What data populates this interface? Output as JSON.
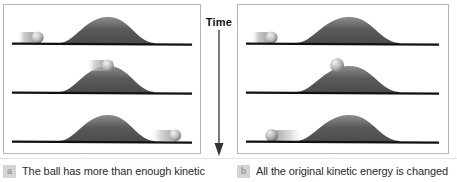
{
  "figure": {
    "time_axis": {
      "label": "Time",
      "direction": "down",
      "arrow_icon": "down-arrow-icon"
    },
    "panels": [
      {
        "id": "a",
        "badge": "a",
        "caption": "The ball has more than enough kinetic",
        "frames": [
          {
            "index": 0,
            "description": "Ball approaching hill from the left with motion blur",
            "ball_x_pct": 14,
            "ball_on_hill": false,
            "motion_blur": true,
            "blur_direction": "left"
          },
          {
            "index": 1,
            "description": "Ball at the crest of the hill, still moving",
            "ball_x_pct": 52,
            "ball_on_hill": true,
            "motion_blur": true,
            "blur_direction": "left"
          },
          {
            "index": 2,
            "description": "Ball has crossed over and moves away to the right",
            "ball_x_pct": 86,
            "ball_on_hill": false,
            "motion_blur": true,
            "blur_direction": "left"
          }
        ]
      },
      {
        "id": "b",
        "badge": "b",
        "caption": "All the original kinetic energy is changed",
        "frames": [
          {
            "index": 0,
            "description": "Ball approaching hill from the left with motion blur",
            "ball_x_pct": 14,
            "ball_on_hill": false,
            "motion_blur": true,
            "blur_direction": "left"
          },
          {
            "index": 1,
            "description": "Ball at rest on the crest of the hill",
            "ball_x_pct": 47,
            "ball_on_hill": true,
            "motion_blur": false,
            "blur_direction": "none"
          },
          {
            "index": 2,
            "description": "Ball rolled back down and moves away to the left",
            "ball_x_pct": 15,
            "ball_on_hill": false,
            "motion_blur": true,
            "blur_direction": "right"
          }
        ]
      }
    ],
    "colors": {
      "ground_line": "#111111",
      "hill_dark": "#4e4e4e",
      "hill_light": "#8d8d8d",
      "ball_light": "#e8e8e8",
      "ball_dark": "#6e6e6e",
      "panel_border": "#b5b5b5",
      "badge_bg": "#d4d4d4",
      "caption_text": "#2c2c2c",
      "background": "#ffffff"
    }
  }
}
